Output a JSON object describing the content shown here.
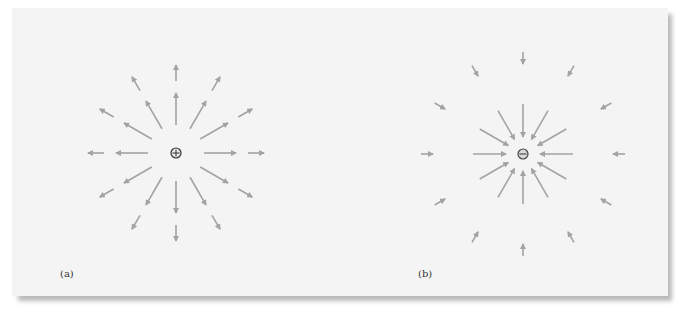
{
  "figure": {
    "panels": [
      {
        "id": "a",
        "label": "(a)",
        "charge_sign": "+",
        "charge_symbol": "⊕",
        "center": [
          176,
          153
        ],
        "field_direction": "outward",
        "directions_deg": [
          0,
          30,
          60,
          90,
          120,
          150,
          180,
          210,
          240,
          270,
          300,
          330
        ],
        "inner_arrow": {
          "r_start": 28,
          "r_end": 60
        },
        "outer_arrow": {
          "r_start": 72,
          "r_end": 88
        }
      },
      {
        "id": "b",
        "label": "(b)",
        "charge_sign": "-",
        "charge_symbol": "⊖",
        "center": [
          523,
          154
        ],
        "field_direction": "inward",
        "directions_deg": [
          0,
          30,
          60,
          90,
          120,
          150,
          180,
          210,
          240,
          270,
          300,
          330
        ],
        "inner_arrow": {
          "r_start": 50,
          "r_end": 17
        },
        "outer_arrow": {
          "r_start": 102,
          "r_end": 90
        }
      }
    ],
    "colors": {
      "arrow": "#a3a3a3",
      "charge_outline": "#444444",
      "panel_bg": "#f4f4f4"
    }
  }
}
